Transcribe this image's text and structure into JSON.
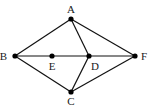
{
  "diagram": {
    "type": "graph",
    "nodes": [
      {
        "id": "A",
        "label": "A",
        "x": 71,
        "y": 19,
        "lx": 71,
        "ly": 13,
        "anchor": "middle"
      },
      {
        "id": "B",
        "label": "B",
        "x": 15,
        "y": 56,
        "lx": 7,
        "ly": 60,
        "anchor": "end"
      },
      {
        "id": "E",
        "label": "E",
        "x": 52,
        "y": 56,
        "lx": 52,
        "ly": 70,
        "anchor": "middle"
      },
      {
        "id": "D",
        "label": "D",
        "x": 89,
        "y": 56,
        "lx": 95,
        "ly": 70,
        "anchor": "middle"
      },
      {
        "id": "F",
        "label": "F",
        "x": 135,
        "y": 56,
        "lx": 141,
        "ly": 60,
        "anchor": "start"
      },
      {
        "id": "C",
        "label": "C",
        "x": 71,
        "y": 92,
        "lx": 71,
        "ly": 105,
        "anchor": "middle"
      }
    ],
    "edges": [
      [
        "A",
        "B"
      ],
      [
        "A",
        "D"
      ],
      [
        "A",
        "F"
      ],
      [
        "B",
        "E"
      ],
      [
        "E",
        "D"
      ],
      [
        "D",
        "F"
      ],
      [
        "B",
        "C"
      ],
      [
        "C",
        "D"
      ],
      [
        "C",
        "F"
      ]
    ],
    "colors": {
      "edge": "#111111",
      "node": "#000000",
      "background": "#ffffff"
    }
  }
}
